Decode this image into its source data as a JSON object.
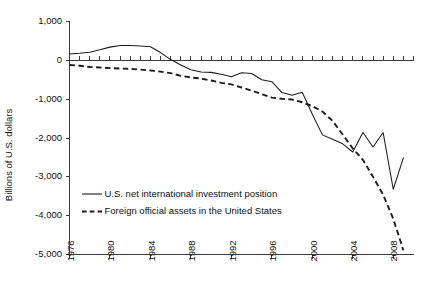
{
  "chart_data": {
    "type": "line",
    "title": "",
    "xlabel": "",
    "ylabel": "Billions of U.S. dollars",
    "xlim": [
      1976,
      2010
    ],
    "ylim": [
      -5000,
      1000
    ],
    "yticks": [
      1000,
      0,
      -1000,
      -2000,
      -3000,
      -4000,
      -5000
    ],
    "ytick_labels": [
      "1,000",
      "0",
      "-1,000",
      "-2,000",
      "-3,000",
      "-4,000",
      "-5,000"
    ],
    "xticks": [
      1976,
      1980,
      1984,
      1988,
      1992,
      1996,
      2000,
      2004,
      2008
    ],
    "xtick_labels": [
      "1976",
      "1980",
      "1984",
      "1988",
      "1992",
      "1996",
      "2000",
      "2004",
      "2008"
    ],
    "x_minor_tick_interval": 1,
    "grid": false,
    "legend_position": "lower-left-inside",
    "x": [
      1976,
      1977,
      1978,
      1979,
      1980,
      1981,
      1982,
      1983,
      1984,
      1985,
      1986,
      1987,
      1988,
      1989,
      1990,
      1991,
      1992,
      1993,
      1994,
      1995,
      1996,
      1997,
      1998,
      1999,
      2000,
      2001,
      2002,
      2003,
      2004,
      2005,
      2006,
      2007,
      2008,
      2009
    ],
    "series": [
      {
        "name": "U.S. net international investment position",
        "style": "solid",
        "color": "#1c1c1c",
        "values": [
          165,
          180,
          210,
          270,
          340,
          380,
          380,
          370,
          350,
          200,
          20,
          -120,
          -240,
          -300,
          -310,
          -360,
          -420,
          -320,
          -340,
          -500,
          -550,
          -830,
          -900,
          -820,
          -1390,
          -1920,
          -2030,
          -2150,
          -2360,
          -1860,
          -2230,
          -1860,
          -3320,
          -2510
        ]
      },
      {
        "name": "Foreign official assets in the United States",
        "style": "dashed",
        "color": "#1c1c1c",
        "values": [
          -120,
          -140,
          -170,
          -185,
          -200,
          -210,
          -220,
          -240,
          -260,
          -290,
          -330,
          -400,
          -440,
          -470,
          -520,
          -580,
          -620,
          -700,
          -780,
          -870,
          -960,
          -990,
          -1010,
          -1080,
          -1180,
          -1320,
          -1560,
          -1910,
          -2270,
          -2560,
          -3000,
          -3460,
          -4080,
          -4890
        ]
      }
    ]
  },
  "legend": {
    "items": [
      {
        "label": "U.S. net international investment position",
        "style": "solid"
      },
      {
        "label": "Foreign official assets in the United States",
        "style": "dashed"
      }
    ]
  }
}
